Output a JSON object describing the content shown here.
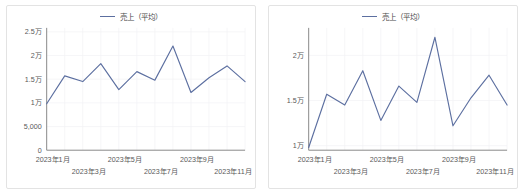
{
  "legend": {
    "label": "売上（平均）",
    "color": "#5c6fa0",
    "swatch_icon": "line-swatch-icon"
  },
  "colors": {
    "series": "#5c6fa0",
    "grid": "#f2f2f5",
    "axis": "#8a8a8a",
    "panel_border": "#e3e3e3",
    "tick_text": "#5a5a5a",
    "background": "#ffffff"
  },
  "panels": [
    {
      "name": "sales-average-chart-full-scale",
      "chart_index": 0
    },
    {
      "name": "sales-average-chart-zoomed-scale",
      "chart_index": 1
    }
  ],
  "chart_data": [
    {
      "type": "line",
      "title": "",
      "subtitle": "",
      "xlabel": "",
      "ylabel": "",
      "grid": true,
      "legend_position": "top-center",
      "series": [
        {
          "name": "売上（平均）",
          "color": "#5c6fa0",
          "values": [
            9800,
            15700,
            14500,
            18300,
            12800,
            16600,
            14800,
            22000,
            12200,
            15300,
            17800,
            14500
          ]
        }
      ],
      "categories": [
        "2023年1月",
        "2023年2月",
        "2023年3月",
        "2023年4月",
        "2023年5月",
        "2023年6月",
        "2023年7月",
        "2023年8月",
        "2023年9月",
        "2023年10月",
        "2023年11月",
        "2023年12月"
      ],
      "ylim": [
        0,
        25000
      ],
      "yticks": [
        0,
        5000,
        10000,
        15000,
        20000,
        25000
      ],
      "ytick_labels": [
        "0",
        "5,000",
        "1万",
        "1.5万",
        "2万",
        "2.5万"
      ],
      "xtick_labels_row1": [
        "2023年1月",
        "2023年5月",
        "2023年9月"
      ],
      "xtick_labels_row2": [
        "2023年3月",
        "2023年7月",
        "2023年11月"
      ],
      "xtick_indices_row1": [
        0,
        4,
        8
      ],
      "xtick_indices_row2": [
        2,
        6,
        10
      ]
    },
    {
      "type": "line",
      "title": "",
      "subtitle": "",
      "xlabel": "",
      "ylabel": "",
      "grid": true,
      "legend_position": "top-center",
      "series": [
        {
          "name": "売上（平均）",
          "color": "#5c6fa0",
          "values": [
            9800,
            15700,
            14500,
            18300,
            12800,
            16600,
            14800,
            22000,
            12200,
            15300,
            17800,
            14500
          ]
        }
      ],
      "categories": [
        "2023年1月",
        "2023年2月",
        "2023年3月",
        "2023年4月",
        "2023年5月",
        "2023年6月",
        "2023年7月",
        "2023年8月",
        "2023年9月",
        "2023年10月",
        "2023年11月",
        "2023年12月"
      ],
      "ylim": [
        9500,
        22600
      ],
      "yticks": [
        10000,
        15000,
        20000
      ],
      "ytick_labels": [
        "1万",
        "1.5万",
        "2万"
      ],
      "xtick_labels_row1": [
        "2023年1月",
        "2023年5月",
        "2023年9月"
      ],
      "xtick_labels_row2": [
        "2023年3月",
        "2023年7月",
        "2023年11月"
      ],
      "xtick_indices_row1": [
        0,
        4,
        8
      ],
      "xtick_indices_row2": [
        2,
        6,
        10
      ]
    }
  ]
}
